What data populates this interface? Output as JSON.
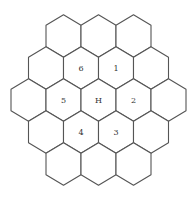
{
  "diagram": {
    "type": "hex-grid",
    "rows": [
      3,
      4,
      5,
      4,
      3
    ],
    "hex_width": 35,
    "row_step": 32,
    "center": [
      98.5,
      100
    ],
    "stroke_color": "#555555",
    "background": "#ffffff",
    "labels": [
      {
        "row": 1,
        "col": 1,
        "text": "6"
      },
      {
        "row": 1,
        "col": 2,
        "text": "1"
      },
      {
        "row": 2,
        "col": 1,
        "text": "5"
      },
      {
        "row": 2,
        "col": 2,
        "text": "H"
      },
      {
        "row": 2,
        "col": 3,
        "text": "2"
      },
      {
        "row": 3,
        "col": 1,
        "text": "4"
      },
      {
        "row": 3,
        "col": 2,
        "text": "3"
      }
    ]
  }
}
